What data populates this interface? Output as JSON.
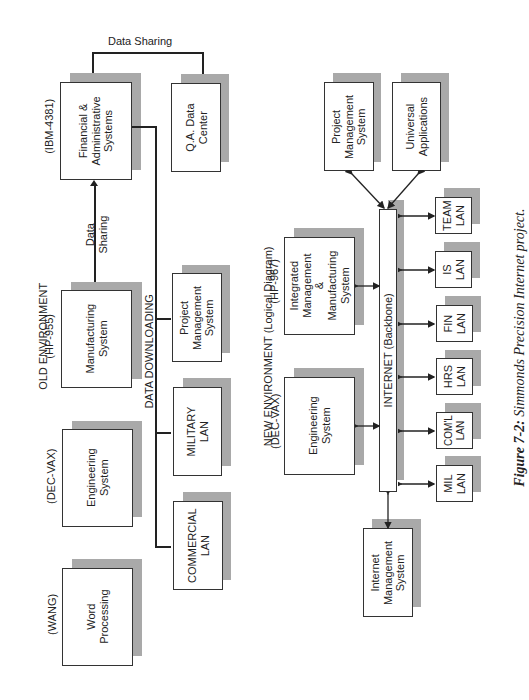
{
  "top_label": "Data Sharing",
  "old_env": {
    "title": "OLD ENVIRONMENT",
    "data_sharing": "Data\nSharing",
    "data_downloading": "DATA DOWNLOADING",
    "systems": [
      {
        "platform": "(IBM-4381)",
        "label": "Financial &\nAdministrative\nSystems"
      },
      {
        "platform": "(HP-955)",
        "label": "Manufacturing\nSystem"
      },
      {
        "platform": "(DEC-VAX)",
        "label": "Engineering\nSystem"
      },
      {
        "platform": "(WANG)",
        "label": "Word\nProcessing"
      }
    ],
    "targets": [
      {
        "label": "Q.A. Data\nCenter"
      },
      {
        "label": "Project\nManagement\nSystem"
      },
      {
        "label": "MILITARY\nLAN"
      },
      {
        "label": "COMMERCIAL\nLAN"
      }
    ]
  },
  "new_env": {
    "title": "NEW ENVIRONMENT (Logical Diagram)",
    "backbone": "INTERNET (Backbone)",
    "systems": [
      {
        "platform": "(HP-967)",
        "label": "Integrated\nManagement\n&\nManufacturing\nSystem"
      },
      {
        "platform": "(DEC-VAX)",
        "label": "Engineering\nSystem"
      },
      {
        "platform": "",
        "label": "Internet\nManagement\nSystem"
      }
    ],
    "apps": [
      {
        "label": "Project\nManagement\nSystem"
      },
      {
        "label": "Universal\nApplications"
      }
    ],
    "lans": [
      {
        "label": "TEAM\nLAN"
      },
      {
        "label": "IS\nLAN"
      },
      {
        "label": "FIN\nLAN"
      },
      {
        "label": "HRS\nLAN"
      },
      {
        "label": "COM'L\nLAN"
      },
      {
        "label": "MIL\nLAN"
      }
    ]
  },
  "caption": {
    "figure": "Figure 7-2:",
    "text": " Simmonds Precision Internet project."
  }
}
